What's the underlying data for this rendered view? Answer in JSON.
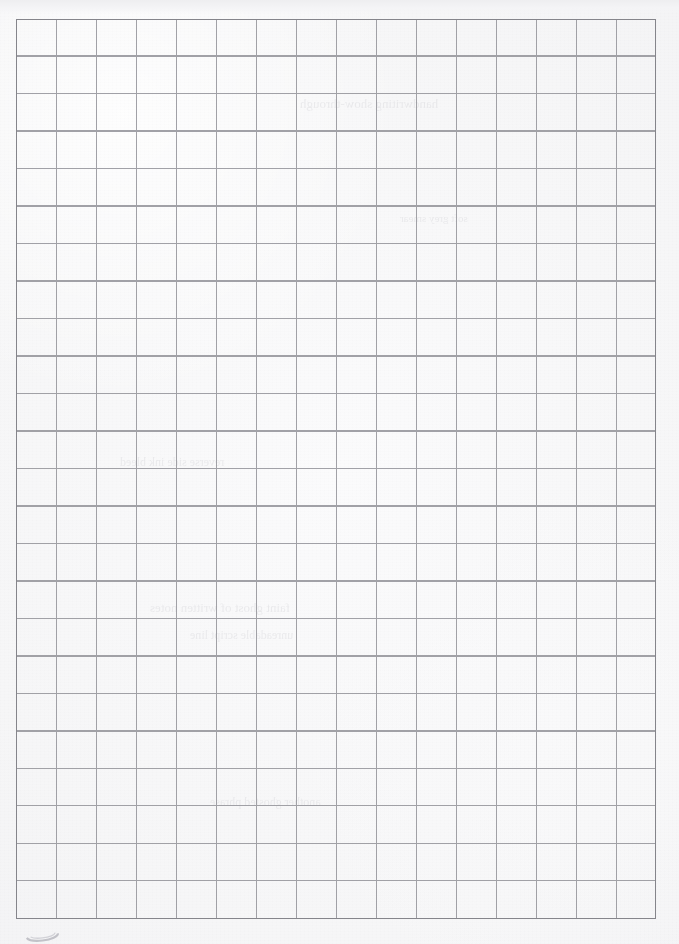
{
  "document": {
    "kind": "scanned-grid-paper",
    "title": "Blank squared / graph paper sheet (scan)",
    "page_width_px": 679,
    "page_height_px": 944,
    "background_color": "#f8f8f9",
    "paper_tint": "#fbfbfc",
    "is_blank": true,
    "handwriting_present": false
  },
  "grid": {
    "columns": 16,
    "rows": 24,
    "origin_x_px": 16,
    "origin_y_px": 19,
    "cell_width_px": 40,
    "cell_height_px": 37.5,
    "width_px": 640,
    "height_px": 900,
    "line_color": "#9a9aa0",
    "border_color": "#85858b",
    "line_width_px": 1,
    "border_width_px": 1.4,
    "column_labels": [
      "1",
      "2",
      "3",
      "4",
      "5",
      "6",
      "7",
      "8",
      "9",
      "10",
      "11",
      "12",
      "13",
      "14",
      "15",
      "16"
    ],
    "row_labels": [
      "1",
      "2",
      "3",
      "4",
      "5",
      "6",
      "7",
      "8",
      "9",
      "10",
      "11",
      "12",
      "13",
      "14",
      "15",
      "16",
      "17",
      "18",
      "19",
      "20",
      "21",
      "22",
      "23",
      "24"
    ],
    "cell_contents": []
  },
  "margins": {
    "left_px": 16,
    "right_px": 22,
    "top_px": 19,
    "bottom_px": 16,
    "margin_color": "#f4f4f6"
  },
  "artifacts": {
    "scan_top_band": {
      "name": "scanner-edge-band",
      "height_px": 14,
      "color": "#eeeef0"
    },
    "corner_mark": {
      "name": "stray-ink-mark",
      "shape": "partial-oval",
      "x_px": 20,
      "y_px": 928,
      "width_px": 40,
      "height_px": 16,
      "color": "#c4c4c9"
    },
    "show_through": {
      "note": "Faint bleed-through of handwriting from reverse side of sheet; illegible.",
      "color": "#c9c9ce",
      "opacity": 0.3,
      "lines": [
        {
          "text": "handwriting show-through",
          "x_px": 300,
          "y_px": 96,
          "size_px": 13
        },
        {
          "text": "reverse side ink bleed",
          "x_px": 120,
          "y_px": 455,
          "size_px": 12
        },
        {
          "text": "faint ghost of written notes",
          "x_px": 150,
          "y_px": 600,
          "size_px": 13
        },
        {
          "text": "unreadable script line",
          "x_px": 190,
          "y_px": 628,
          "size_px": 12
        },
        {
          "text": "another ghosted phrase",
          "x_px": 210,
          "y_px": 795,
          "size_px": 12
        },
        {
          "text": "soft grey smear",
          "x_px": 400,
          "y_px": 212,
          "size_px": 11
        }
      ]
    }
  }
}
